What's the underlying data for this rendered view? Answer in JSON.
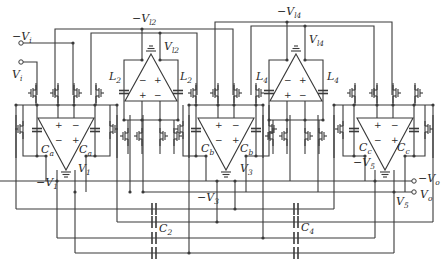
{
  "diagram": {
    "type": "circuit-schematic",
    "stroke_color": "#3a3a3a",
    "background": "#ffffff",
    "inputs": [
      {
        "id": "neg-vi",
        "label": "−V",
        "sub": "i"
      },
      {
        "id": "vi",
        "label": "V",
        "sub": "i"
      }
    ],
    "outputs": [
      {
        "id": "neg-vo",
        "label": "−V",
        "sub": "o"
      },
      {
        "id": "vo",
        "label": "V",
        "sub": "o"
      }
    ],
    "amplifiers": [
      {
        "id": "amp1",
        "kind": "main",
        "inputs_top": [
          "+",
          "−"
        ],
        "inputs_bottom": [
          "−",
          "+"
        ],
        "cap_label": "C",
        "cap_sub": "a",
        "out_pos": "V",
        "out_pos_sub": "1",
        "out_neg": "−V",
        "out_neg_sub": "1"
      },
      {
        "id": "amp2",
        "kind": "inductor",
        "inputs_top": [
          "−",
          "+"
        ],
        "inputs_bottom": [
          "+",
          "−"
        ],
        "l_label": "L",
        "l_sub": "2",
        "out_pos": "V",
        "out_pos_sub": "l2",
        "out_neg": "−V",
        "out_neg_sub": "l2"
      },
      {
        "id": "amp3",
        "kind": "main",
        "inputs_top": [
          "+",
          "−"
        ],
        "inputs_bottom": [
          "−",
          "+"
        ],
        "cap_label": "C",
        "cap_sub": "b",
        "out_pos": "V",
        "out_pos_sub": "3",
        "out_neg": "−V",
        "out_neg_sub": "3"
      },
      {
        "id": "amp4",
        "kind": "inductor",
        "inputs_top": [
          "−",
          "+"
        ],
        "inputs_bottom": [
          "+",
          "−"
        ],
        "l_label": "L",
        "l_sub": "4",
        "out_pos": "V",
        "out_pos_sub": "l4",
        "out_neg": "−V",
        "out_neg_sub": "l4"
      },
      {
        "id": "amp5",
        "kind": "main",
        "inputs_top": [
          "+",
          "−"
        ],
        "inputs_bottom": [
          "−",
          "+"
        ],
        "cap_label": "C",
        "cap_sub": "c",
        "out_pos": "V",
        "out_pos_sub": "5",
        "out_neg": "−V",
        "out_neg_sub": "5"
      }
    ],
    "coupling_caps": [
      {
        "id": "c2",
        "label": "C",
        "sub": "2"
      },
      {
        "id": "c4",
        "label": "C",
        "sub": "4"
      }
    ],
    "signs": {
      "plus": "+",
      "minus": "−"
    }
  }
}
